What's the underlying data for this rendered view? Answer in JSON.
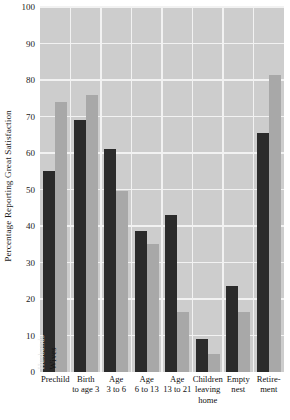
{
  "chart_data": {
    "type": "bar",
    "title": "",
    "xlabel": "",
    "ylabel": "Percentage Reporting Great Satisfaction",
    "ylim": [
      0,
      100
    ],
    "ytick_labels": [
      "0",
      "10",
      "20",
      "30",
      "40",
      "50",
      "60",
      "70",
      "80",
      "90",
      "100"
    ],
    "yticks": [
      0,
      10,
      20,
      30,
      40,
      50,
      60,
      70,
      80,
      90,
      100
    ],
    "grid": "horizontal-and-vertical",
    "legend_position": "in-first-group (rotated in-bar labels)",
    "categories": [
      "Prechild",
      "Birth to age 3",
      "Age 3 to 6",
      "Age 6 to 13",
      "Age 13 to 21",
      "Children leaving home",
      "Empty nest",
      "Retirement"
    ],
    "category_lines": [
      [
        "Prechild"
      ],
      [
        "Birth",
        "to age 3"
      ],
      [
        "Age",
        "3 to 6"
      ],
      [
        "Age",
        "6 to 13"
      ],
      [
        "Age",
        "13 to 21"
      ],
      [
        "Children",
        "leaving",
        "home"
      ],
      [
        "Empty",
        "nest"
      ],
      [
        "Retire-",
        "ment"
      ]
    ],
    "series": [
      {
        "name": "Husbands",
        "color": "#2b2b2b",
        "values": [
          55,
          69,
          61,
          38.5,
          43,
          9,
          23.5,
          65.5
        ]
      },
      {
        "name": "Wives",
        "color": "#a8a8a8",
        "values": [
          74,
          76,
          49.5,
          35,
          16.5,
          5,
          16.5,
          81.5
        ]
      }
    ]
  },
  "style": {
    "plot_background": "#cdcdcd",
    "gridline_color": "#f2f2f2",
    "page_background": "#ffffff",
    "text_color": "#1a1a1a"
  }
}
